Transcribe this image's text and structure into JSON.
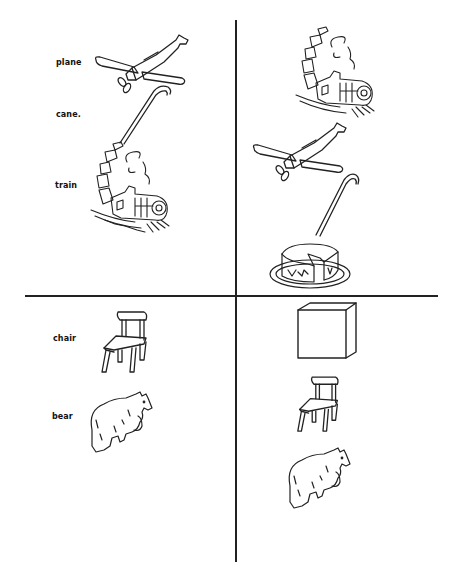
{
  "worksheet": {
    "quadrants": [
      {
        "id": "top-left",
        "labels": [
          "plane",
          "cane.",
          "train"
        ],
        "pictures": [
          "plane",
          "cane",
          "train"
        ]
      },
      {
        "id": "top-right",
        "labels": [],
        "pictures": [
          "train",
          "plane",
          "cane",
          "cake"
        ]
      },
      {
        "id": "bottom-left",
        "labels": [
          "chair",
          "bear"
        ],
        "pictures": [
          "chair",
          "bear"
        ]
      },
      {
        "id": "bottom-right",
        "labels": [],
        "pictures": [
          "box",
          "chair",
          "bear"
        ]
      }
    ]
  },
  "colors": {
    "ink": "#222222",
    "background": "#ffffff"
  }
}
